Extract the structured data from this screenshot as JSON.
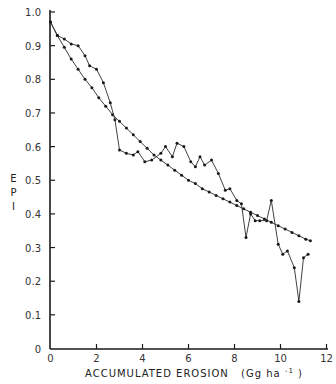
{
  "chart_data": {
    "type": "line",
    "title": "",
    "xlabel": "ACCUMULATED EROSION (Gg ha⁻¹)",
    "xlabel_parts": {
      "main": "ACCUMULATED  EROSION",
      "unit": "(Gg  ha",
      "exp": "-1",
      "close": ")"
    },
    "ylabel": "EPI",
    "ylabel_letters": [
      "E",
      "P",
      "I"
    ],
    "xlim": [
      0,
      12
    ],
    "ylim": [
      0,
      1.0
    ],
    "x_ticks": [
      0,
      2,
      4,
      6,
      8,
      10,
      12
    ],
    "x_tick_labels": [
      "0",
      "2",
      "4",
      "6",
      "8",
      "10",
      "12"
    ],
    "y_ticks": [
      0,
      0.1,
      0.2,
      0.3,
      0.4,
      0.5,
      0.6,
      0.7,
      0.8,
      0.9,
      1.0
    ],
    "y_tick_labels": [
      "0",
      "0.1",
      "0.2",
      "0.3",
      "0.4",
      "0.5",
      "0.6",
      "0.7",
      "0.8",
      "0.9",
      "1.0"
    ],
    "grid": false,
    "legend": null,
    "series": [
      {
        "name": "smooth",
        "x": [
          0,
          0.3,
          0.6,
          0.9,
          1.2,
          1.5,
          1.8,
          2.1,
          2.4,
          2.7,
          3.0,
          3.3,
          3.6,
          3.9,
          4.2,
          4.5,
          4.8,
          5.1,
          5.4,
          5.7,
          6.0,
          6.3,
          6.6,
          6.9,
          7.2,
          7.5,
          7.8,
          8.1,
          8.4,
          8.7,
          9.0,
          9.3,
          9.6,
          9.9,
          10.2,
          10.5,
          10.8,
          11.1,
          11.3
        ],
        "y": [
          0.97,
          0.93,
          0.895,
          0.86,
          0.83,
          0.8,
          0.775,
          0.745,
          0.72,
          0.695,
          0.675,
          0.655,
          0.635,
          0.615,
          0.595,
          0.575,
          0.56,
          0.545,
          0.53,
          0.515,
          0.5,
          0.49,
          0.475,
          0.465,
          0.455,
          0.445,
          0.435,
          0.425,
          0.415,
          0.405,
          0.395,
          0.385,
          0.375,
          0.365,
          0.355,
          0.345,
          0.335,
          0.325,
          0.32
        ]
      },
      {
        "name": "observed",
        "x": [
          0,
          0.3,
          0.6,
          0.9,
          1.2,
          1.5,
          1.7,
          2.0,
          2.3,
          2.6,
          2.8,
          3.0,
          3.3,
          3.6,
          3.8,
          4.1,
          4.4,
          4.8,
          5.0,
          5.3,
          5.5,
          5.8,
          6.1,
          6.3,
          6.5,
          6.7,
          7.0,
          7.3,
          7.6,
          7.8,
          8.1,
          8.3,
          8.5,
          8.7,
          8.9,
          9.1,
          9.4,
          9.6,
          9.9,
          10.1,
          10.3,
          10.6,
          10.8,
          11.0,
          11.2
        ],
        "y": [
          0.97,
          0.93,
          0.92,
          0.905,
          0.9,
          0.87,
          0.84,
          0.83,
          0.79,
          0.73,
          0.68,
          0.59,
          0.58,
          0.575,
          0.585,
          0.555,
          0.56,
          0.58,
          0.6,
          0.57,
          0.61,
          0.6,
          0.555,
          0.54,
          0.57,
          0.545,
          0.56,
          0.52,
          0.47,
          0.475,
          0.44,
          0.43,
          0.33,
          0.4,
          0.38,
          0.38,
          0.38,
          0.44,
          0.31,
          0.28,
          0.29,
          0.24,
          0.14,
          0.27,
          0.28
        ]
      }
    ],
    "colors": {
      "line": "#2b2b2b",
      "axis": "#1a1a1a",
      "marker": "#1a1a1a"
    }
  }
}
